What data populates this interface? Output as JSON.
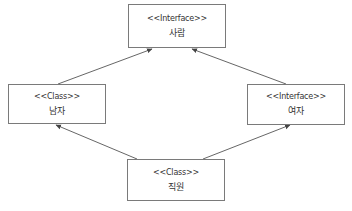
{
  "diagram": {
    "type": "uml-class-diagram",
    "nodes": [
      {
        "id": "person",
        "stereotype": "<<Interface>>",
        "name": "사람"
      },
      {
        "id": "male",
        "stereotype": "<<Class>>",
        "name": "남자"
      },
      {
        "id": "female",
        "stereotype": "<<Interface>>",
        "name": "여자"
      },
      {
        "id": "staff",
        "stereotype": "<<Class>>",
        "name": "직원"
      }
    ],
    "edges": [
      {
        "from": "male",
        "to": "person",
        "arrow": "filled-small"
      },
      {
        "from": "female",
        "to": "person",
        "arrow": "filled-small"
      },
      {
        "from": "staff",
        "to": "male",
        "arrow": "filled-small"
      },
      {
        "from": "staff",
        "to": "female",
        "arrow": "filled-small"
      }
    ],
    "colors": {
      "box_border": "#7a7a7a",
      "line": "#555555",
      "text": "#333333",
      "background": "#ffffff"
    }
  }
}
